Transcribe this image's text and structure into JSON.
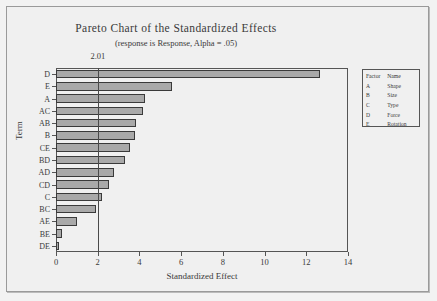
{
  "chart_data": {
    "type": "bar",
    "orientation": "horizontal",
    "title": "Pareto Chart of the Standardized Effects",
    "subtitle": "(response is Response, Alpha = .05)",
    "xlabel": "Standardized Effect",
    "ylabel": "Term",
    "xlim": [
      0,
      14
    ],
    "xticks": [
      0,
      2,
      4,
      6,
      8,
      10,
      12,
      14
    ],
    "grid": false,
    "legend_position": "right-outside",
    "reference_line": {
      "value": 2.01,
      "label": "2.01"
    },
    "categories": [
      "D",
      "E",
      "A",
      "AC",
      "AB",
      "B",
      "CE",
      "BD",
      "AD",
      "CD",
      "C",
      "BC",
      "AE",
      "BE",
      "DE"
    ],
    "values": [
      12.65,
      5.55,
      4.25,
      4.15,
      3.85,
      3.8,
      3.55,
      3.3,
      2.8,
      2.55,
      2.2,
      1.9,
      1.0,
      0.3,
      0.15
    ],
    "bar_color": "#a9a9a9",
    "bar_edge_color": "#3a3a3a"
  },
  "legend": {
    "headers": [
      "Factor",
      "Name"
    ],
    "rows": [
      {
        "factor": "A",
        "name": "Shape"
      },
      {
        "factor": "B",
        "name": "Size"
      },
      {
        "factor": "C",
        "name": "Type"
      },
      {
        "factor": "D",
        "name": "Force"
      },
      {
        "factor": "E",
        "name": "Rotation"
      }
    ]
  }
}
